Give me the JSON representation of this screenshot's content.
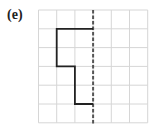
{
  "figure": {
    "label": "(e)",
    "grid": {
      "cols": 6,
      "rows": 6,
      "left": 38.5,
      "top": 10,
      "cell_w": 18.2,
      "cell_h": 18.8,
      "line_color": "#d6d6d6"
    },
    "mirror_line": {
      "style": "dashed",
      "col": 3,
      "color": "#555555"
    },
    "shape_path_grid_coords": [
      [
        3,
        1
      ],
      [
        1,
        1
      ],
      [
        1,
        3
      ],
      [
        2,
        3
      ],
      [
        2,
        5
      ],
      [
        3,
        5
      ]
    ],
    "shape_color": "#222222"
  }
}
